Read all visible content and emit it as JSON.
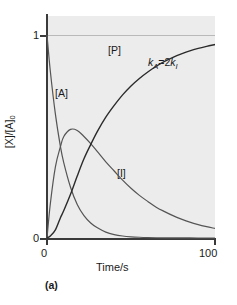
{
  "figure": {
    "caption": "(a)",
    "annotation_k": "k",
    "annotation_sub_a": "A",
    "annotation_eq": "=2",
    "annotation_k2": "k",
    "annotation_sub_i": "I"
  },
  "axes": {
    "ylabel_main": "[X]/[A]",
    "ylabel_sub": "0",
    "xlabel": "Time/s",
    "y_ticks": [
      "1",
      "0"
    ],
    "x_ticks": [
      "0",
      "100"
    ]
  },
  "series_labels": {
    "product": "[P]",
    "reactant": "[A]",
    "intermediate": "[I]"
  },
  "chart_data": {
    "type": "line",
    "title": "",
    "subtitle": "",
    "caption": "(a)",
    "xlabel": "Time/s",
    "ylabel": "[X]/[A]0",
    "xlim": [
      0,
      100
    ],
    "ylim": [
      0,
      1
    ],
    "xticks": [
      0,
      100
    ],
    "yticks": [
      0,
      1
    ],
    "grid": "horizontal gridline at y=1 only",
    "legend": "inline labels on curves",
    "annotations": [
      {
        "text": "kA=2kI",
        "x": 62,
        "y": 0.79
      }
    ],
    "x": [
      0,
      2,
      5,
      8,
      10,
      14,
      18,
      22,
      26,
      30,
      35,
      40,
      45,
      50,
      55,
      60,
      65,
      70,
      75,
      80,
      85,
      90,
      95,
      100
    ],
    "series": [
      {
        "name": "[A]",
        "label": "[A]",
        "description": "reactant, exponential decay exp(-kA*t) with kA=2kI",
        "values": [
          1.0,
          0.82,
          0.61,
          0.45,
          0.37,
          0.25,
          0.165,
          0.11,
          0.074,
          0.05,
          0.029,
          0.017,
          0.01,
          0.006,
          0.0036,
          0.0021,
          0.0012,
          0.0007,
          0.0004,
          0.0003,
          0.0002,
          0.0001,
          0.0001,
          0.0
        ],
        "color": "#555555"
      },
      {
        "name": "[I]",
        "label": "[I]",
        "description": "intermediate, rises to a maximum then decays",
        "values": [
          0.0,
          0.17,
          0.35,
          0.45,
          0.5,
          0.535,
          0.53,
          0.5,
          0.465,
          0.425,
          0.375,
          0.33,
          0.285,
          0.245,
          0.21,
          0.18,
          0.152,
          0.13,
          0.11,
          0.093,
          0.078,
          0.066,
          0.056,
          0.047
        ],
        "color": "#555555"
      },
      {
        "name": "[P]",
        "label": "[P]",
        "description": "product, sigmoidal rise approaching 1",
        "values": [
          0.0,
          0.01,
          0.04,
          0.1,
          0.135,
          0.215,
          0.305,
          0.39,
          0.46,
          0.525,
          0.595,
          0.653,
          0.705,
          0.749,
          0.786,
          0.818,
          0.846,
          0.87,
          0.89,
          0.907,
          0.922,
          0.934,
          0.944,
          0.953
        ],
        "color": "#2b2b2b"
      }
    ]
  }
}
